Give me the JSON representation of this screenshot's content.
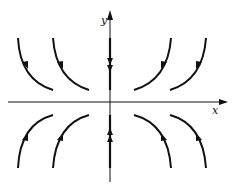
{
  "figure": {
    "type": "phase-portrait",
    "axes": {
      "x_label": "x",
      "y_label": "y"
    },
    "colors": {
      "stroke": "#111111",
      "background": "#ffffff"
    },
    "trajectories": [
      {
        "quadrant": "upper-left",
        "count": 2,
        "direction": "toward x-axis, outward"
      },
      {
        "quadrant": "upper-right",
        "count": 2,
        "direction": "toward x-axis, outward"
      },
      {
        "quadrant": "lower-left",
        "count": 2,
        "direction": "toward x-axis, outward"
      },
      {
        "quadrant": "lower-right",
        "count": 2,
        "direction": "toward x-axis, outward"
      },
      {
        "axis": "positive y-axis",
        "direction": "toward origin"
      },
      {
        "axis": "negative y-axis",
        "direction": "toward origin"
      }
    ]
  }
}
